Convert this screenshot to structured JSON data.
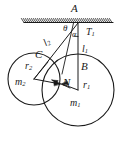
{
  "figure": {
    "type": "physics-free-body-diagram",
    "background_color": "#ffffff",
    "stroke_color": "#1a1a1a"
  },
  "labels": {
    "point_a": "A",
    "point_b": "B",
    "point_c": "C",
    "point_n": "N",
    "angle_theta": "θ",
    "angle_alpha": "α",
    "tension_t1": "T",
    "tension_t1_sub": "1",
    "string_l1": "l",
    "string_l1_sub": "1",
    "string_l2": "l",
    "string_l2_sub": "2",
    "radius_r1": "r",
    "radius_r1_sub": "1",
    "radius_r2": "r",
    "radius_r2_sub": "2",
    "mass_m1": "m",
    "mass_m1_sub": "1",
    "mass_m2": "m",
    "mass_m2_sub": "2"
  },
  "geometry": {
    "ceiling": {
      "x_start": 24,
      "x_end": 113,
      "y": 22,
      "hatch_count": 44
    },
    "suspension_point": {
      "x": 78,
      "y": 23
    },
    "circle_large": {
      "cx": 78,
      "cy": 90,
      "r": 36,
      "label": "m1"
    },
    "circle_small": {
      "cx": 34,
      "cy": 79,
      "r": 26,
      "label": "m2"
    },
    "contact_point": {
      "x": 60,
      "y": 84
    },
    "point_b": {
      "x": 78,
      "y": 54
    },
    "point_c": {
      "x": 40,
      "y": 58
    }
  }
}
